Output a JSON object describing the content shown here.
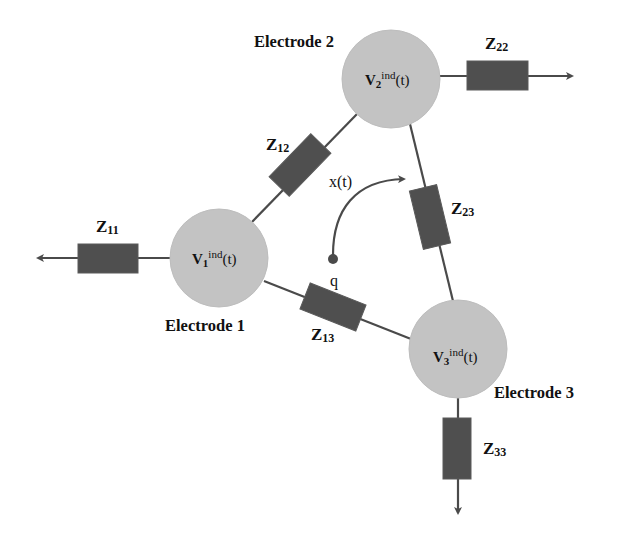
{
  "electrodes": [
    {
      "label": "Electrode 1",
      "voltage": {
        "symbol": "V",
        "sub": "1",
        "sup": "ind",
        "arg": "(t)"
      }
    },
    {
      "label": "Electrode 2",
      "voltage": {
        "symbol": "V",
        "sub": "2",
        "sup": "ind",
        "arg": "(t)"
      }
    },
    {
      "label": "Electrode 3",
      "voltage": {
        "symbol": "V",
        "sub": "3",
        "sup": "ind",
        "arg": "(t)"
      }
    }
  ],
  "impedances": {
    "z11": {
      "symbol": "Z",
      "sub": "11"
    },
    "z22": {
      "symbol": "Z",
      "sub": "22"
    },
    "z33": {
      "symbol": "Z",
      "sub": "33"
    },
    "z12": {
      "symbol": "Z",
      "sub": "12"
    },
    "z13": {
      "symbol": "Z",
      "sub": "13"
    },
    "z23": {
      "symbol": "Z",
      "sub": "23"
    }
  },
  "charge": {
    "label": "q",
    "trajectory_label": "x(t)"
  },
  "colors": {
    "electrode_fill": "#c3c3c3",
    "resistor_fill": "#4f4f4f",
    "wire": "#4a4a4a",
    "text": "#111111"
  }
}
